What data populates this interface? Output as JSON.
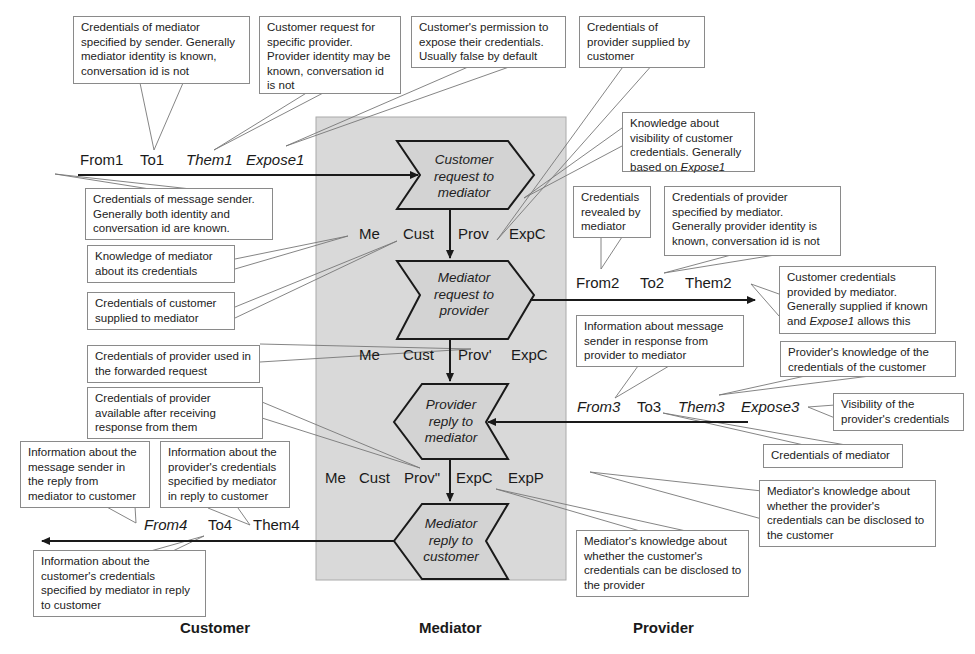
{
  "lanes": {
    "customer": "Customer",
    "mediator": "Mediator",
    "provider": "Provider"
  },
  "steps": {
    "customer_request": "Customer request to mediator",
    "mediator_request": "Mediator request to provider",
    "provider_reply": "Provider reply to mediator",
    "mediator_reply": "Mediator reply to customer"
  },
  "messages": {
    "msg1": {
      "from": "From1",
      "to": "To1",
      "them": "Them1",
      "expose": "Expose1"
    },
    "state1": {
      "me": "Me",
      "cust": "Cust",
      "prov": "Prov",
      "exp": "ExpC"
    },
    "msg2": {
      "from": "From2",
      "to": "To2",
      "them": "Them2"
    },
    "state2": {
      "me": "Me",
      "cust": "Cust",
      "prov": "Prov'",
      "exp": "ExpC"
    },
    "msg3": {
      "from": "From3",
      "to": "To3",
      "them": "Them3",
      "expose": "Expose3"
    },
    "state3": {
      "me": "Me",
      "cust": "Cust",
      "prov": "Prov\"",
      "expc": "ExpC",
      "expp": "ExpP"
    },
    "msg4": {
      "from": "From4",
      "to": "To4",
      "them": "Them4"
    }
  },
  "callouts": {
    "to1": "Credentials of mediator specified by sender. Generally mediator identity is known, conversation id is not",
    "them1": "Customer request for specific provider. Provider identity may be known, conversation id is not",
    "expose1": "Customer's permission to expose their credentials. Usually false by default",
    "prov": "Credentials of provider supplied by customer",
    "expc_pre": "Knowledge about visibility of customer credentials. Generally based on ",
    "expc_em": "Expose1",
    "from1": "Credentials of message sender. Generally both identity and conversation id are known.",
    "me": "Knowledge of mediator about its credentials",
    "cust": "Credentials of customer supplied to mediator",
    "from2": "Credentials revealed by mediator",
    "to2": "Credentials of provider specified by mediator. Generally provider identity is known, conversation id is not",
    "them2_pre": "Customer credentials provided by mediator. Generally supplied if known and ",
    "them2_em": "Expose1",
    "them2_post": " allows this",
    "prov_fwd": "Credentials of provider used in the forwarded request",
    "from3": "Information about message sender in response from provider to mediator",
    "them3": "Provider's knowledge of the credentials of the customer",
    "expose3": "Visibility of the provider's credentials",
    "to3": "Credentials of mediator",
    "prov_after": "Credentials of provider available after receiving response from them",
    "from4": "Information about the message sender in the reply from mediator to customer",
    "them4": "Information about the provider's credentials specified by mediator in reply to  customer",
    "expp": "Mediator's knowledge about whether the provider's credentials can be disclosed to the customer",
    "expc": "Mediator's knowledge about whether the customer's credentials can be disclosed to the provider",
    "to4": "Information about the customer's credentials specified by mediator in reply to customer"
  },
  "colors": {
    "mediator_lane": "#d9d9d9",
    "shape_fill": "#d3d3d3",
    "line": "#1a1a1a",
    "callout_border": "#8a8a8a"
  }
}
